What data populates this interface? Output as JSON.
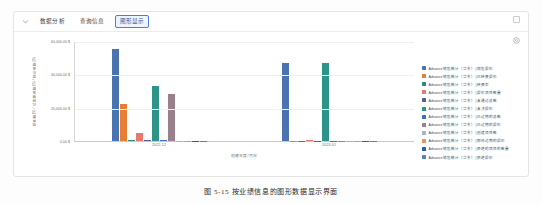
{
  "card": {
    "collapse_icon": "chevron-down-icon",
    "expand_icon": "expand-square-icon",
    "settings_icon": "gear-icon",
    "tabs": [
      {
        "label": "数据分析",
        "active": false
      },
      {
        "label": "查询信息",
        "active": false
      },
      {
        "label": "图形显示",
        "active": true
      }
    ]
  },
  "chart_data": {
    "type": "bar",
    "title": "",
    "xlabel": "创建年度/月份",
    "ylabel": "销售额($) / 已转换金额($) / 报价金额($)",
    "categories": [
      "2022-12",
      "2023-01"
    ],
    "ylim": [
      0,
      60000
    ],
    "yticks": [
      "0.00 $",
      "20,000.00 $",
      "40,000.00 $",
      "60,000.00 $"
    ],
    "ytick_values": [
      0,
      20000,
      40000,
      60000
    ],
    "grid": true,
    "legend_position": "right",
    "series": [
      {
        "name": "Advance 销售统计（华东）| 销售报价",
        "color": "#4a74b0",
        "values": [
          55000,
          47000
        ]
      },
      {
        "name": "Advance 销售统计（华东）| 已转换报价",
        "color": "#e87d34",
        "values": [
          22000,
          0
        ]
      },
      {
        "name": "Advance 销售统计（华东）| 转换率",
        "color": "#2e8b7a",
        "values": [
          400,
          0
        ]
      },
      {
        "name": "Advance 销售统计（华东）| 报价项目数量",
        "color": "#e8796e",
        "values": [
          5000,
          700
        ]
      },
      {
        "name": "Advance 销售统计（华东）| 未通过总数",
        "color": "#5b5b9e",
        "values": [
          400,
          300
        ]
      },
      {
        "name": "Advance 销售统计（华东）| 未决报价",
        "color": "#2f9488",
        "values": [
          33000,
          47000
        ]
      },
      {
        "name": "Advance 销售统计（华东）| 已过期的总数",
        "color": "#3f6fb5",
        "values": [
          400,
          0
        ]
      },
      {
        "name": "Advance 销售统计（华东）| 已过期的报价",
        "color": "#9b7f8c",
        "values": [
          28000,
          0
        ]
      },
      {
        "name": "Advance 销售统计（华东）| 创建项目数",
        "color": "#b0b0b8",
        "values": [
          0,
          0
        ]
      },
      {
        "name": "Advance 销售统计（华东）| 即将过期的报价",
        "color": "#e8925c",
        "values": [
          0,
          0
        ]
      },
      {
        "name": "Advance 销售统计（华东）| 拒绝的项目的数量",
        "color": "#2f5fa8",
        "values": [
          0,
          0
        ]
      },
      {
        "name": "Advance 销售统计（华东）| 拒绝报价",
        "color": "#5a7fc0",
        "values": [
          0,
          0
        ]
      }
    ]
  },
  "caption": "图 5-15  按业绩信息的图形数据显示界面"
}
